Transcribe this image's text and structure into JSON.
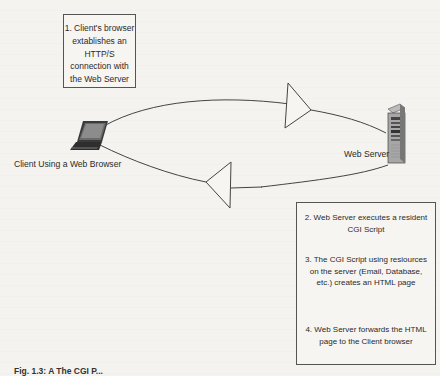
{
  "diagram": {
    "nodes": {
      "client": {
        "label": "Client Using a Web Browser",
        "icon": "laptop-icon"
      },
      "server": {
        "label": "Web Server",
        "icon": "server-tower-icon"
      }
    },
    "boxes": {
      "step1": {
        "text": "1. Client's browser extablishes an HTTP/S connection with the Web Server"
      },
      "step2": {
        "text": "2.  Web Server executes a resident CGI Script"
      },
      "step3": {
        "text": "3. The CGI Script using resiources on the server (Email, Database, etc.) creates an HTML page"
      },
      "step4": {
        "text": "4. Web Server forwards the HTML page to the Client browser"
      }
    },
    "edges": [
      {
        "from": "client",
        "to": "server",
        "direction": "right",
        "style": "curved-arrow-top"
      },
      {
        "from": "server",
        "to": "client",
        "direction": "left",
        "style": "curved-arrow-bottom"
      }
    ],
    "caption": "Fig. 1.3: A The CGI P..."
  }
}
